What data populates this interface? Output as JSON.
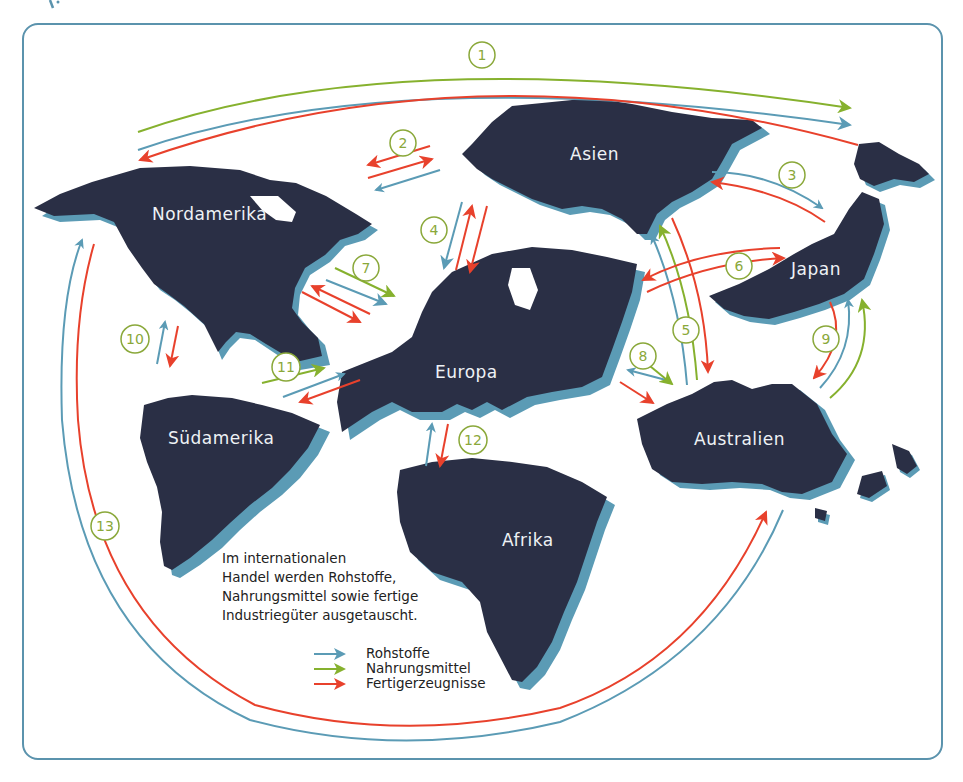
{
  "colors": {
    "frame": "#5b93ad",
    "land": "#2a2f45",
    "land_shadow": "#5b9bb5",
    "rohstoffe": "#5b9bb5",
    "nahrungsmittel": "#86b12e",
    "fertigerzeugnisse": "#e8412c",
    "number_circle": "#8aa83a"
  },
  "continents": [
    {
      "id": "nordamerika",
      "label": "Nordamerika"
    },
    {
      "id": "suedamerika",
      "label": "Südamerika"
    },
    {
      "id": "europa",
      "label": "Europa"
    },
    {
      "id": "afrika",
      "label": "Afrika"
    },
    {
      "id": "asien",
      "label": "Asien"
    },
    {
      "id": "japan",
      "label": "Japan"
    },
    {
      "id": "australien",
      "label": "Australien"
    }
  ],
  "routes": [
    {
      "number": "1",
      "between": [
        "Nordamerika",
        "Japan/Ostasien"
      ],
      "flows": [
        "Nahrungsmittel",
        "Rohstoffe",
        "Fertigerzeugnisse"
      ]
    },
    {
      "number": "2",
      "between": [
        "Nordamerika",
        "Asien"
      ],
      "flows": [
        "Fertigerzeugnisse",
        "Fertigerzeugnisse",
        "Rohstoffe"
      ]
    },
    {
      "number": "3",
      "between": [
        "Asien",
        "Japan"
      ],
      "flows": [
        "Rohstoffe",
        "Fertigerzeugnisse"
      ]
    },
    {
      "number": "4",
      "between": [
        "Europa",
        "Asien"
      ],
      "flows": [
        "Rohstoffe",
        "Fertigerzeugnisse",
        "Fertigerzeugnisse"
      ]
    },
    {
      "number": "5",
      "between": [
        "Asien",
        "Australien"
      ],
      "flows": [
        "Rohstoffe",
        "Nahrungsmittel",
        "Fertigerzeugnisse"
      ]
    },
    {
      "number": "6",
      "between": [
        "Europa",
        "Japan"
      ],
      "flows": [
        "Fertigerzeugnisse",
        "Fertigerzeugnisse"
      ]
    },
    {
      "number": "7",
      "between": [
        "Nordamerika",
        "Europa"
      ],
      "flows": [
        "Nahrungsmittel",
        "Rohstoffe",
        "Fertigerzeugnisse",
        "Fertigerzeugnisse"
      ]
    },
    {
      "number": "8",
      "between": [
        "Europa",
        "Australien"
      ],
      "flows": [
        "Rohstoffe",
        "Nahrungsmittel",
        "Fertigerzeugnisse"
      ]
    },
    {
      "number": "9",
      "between": [
        "Japan",
        "Australien"
      ],
      "flows": [
        "Fertigerzeugnisse",
        "Rohstoffe",
        "Nahrungsmittel"
      ]
    },
    {
      "number": "10",
      "between": [
        "Nordamerika",
        "Südamerika"
      ],
      "flows": [
        "Rohstoffe",
        "Fertigerzeugnisse"
      ]
    },
    {
      "number": "11",
      "between": [
        "Südamerika",
        "Europa"
      ],
      "flows": [
        "Nahrungsmittel",
        "Rohstoffe",
        "Fertigerzeugnisse"
      ]
    },
    {
      "number": "12",
      "between": [
        "Europa",
        "Afrika"
      ],
      "flows": [
        "Rohstoffe",
        "Fertigerzeugnisse"
      ]
    },
    {
      "number": "13",
      "between": [
        "Nordamerika",
        "Australien"
      ],
      "flows": [
        "Rohstoffe",
        "Fertigerzeugnisse"
      ]
    }
  ],
  "caption": {
    "lines": [
      "Im internationalen",
      "Handel werden Rohstoffe,",
      "Nahrungsmittel sowie fertige",
      "Industriegüter ausgetauscht."
    ]
  },
  "legend": {
    "items": [
      {
        "label": "Rohstoffe",
        "color": "#5b9bb5"
      },
      {
        "label": "Nahrungsmittel",
        "color": "#86b12e"
      },
      {
        "label": "Fertigerzeugnisse",
        "color": "#e8412c"
      }
    ]
  }
}
